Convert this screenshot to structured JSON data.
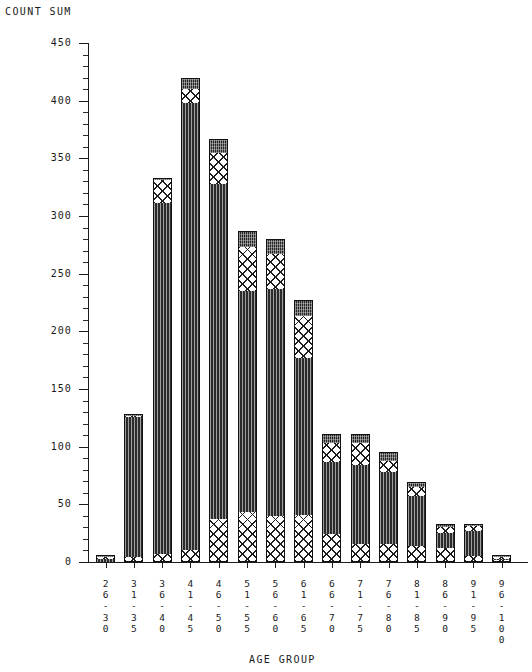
{
  "titles": {
    "y_axis": "COUNT SUM",
    "x_axis": "AGE GROUP"
  },
  "y_ticks": [
    "450",
    "400",
    "350",
    "300",
    "250",
    "200",
    "150",
    "100",
    "50",
    "0"
  ],
  "chart_data": {
    "type": "bar",
    "title": "COUNT SUM",
    "xlabel": "AGE GROUP",
    "ylabel": "COUNT SUM",
    "stacked": true,
    "grid": false,
    "legend": "none",
    "ylim": [
      0,
      450
    ],
    "ytick_step": 50,
    "yminor_step": 10,
    "categories": [
      "26-30",
      "31-35",
      "36-40",
      "41-45",
      "46-50",
      "51-55",
      "56-60",
      "61-65",
      "66-70",
      "71-75",
      "76-80",
      "81-85",
      "86-90",
      "91-95",
      "96-100"
    ],
    "series": [
      {
        "name": "segment-1-hatch-bottom",
        "pattern": "crosshatch",
        "values": [
          0,
          4,
          7,
          10,
          37,
          43,
          40,
          41,
          24,
          16,
          16,
          14,
          12,
          5,
          2
        ]
      },
      {
        "name": "segment-2-solid",
        "pattern": "solid-dark",
        "values": [
          3,
          122,
          304,
          388,
          291,
          192,
          197,
          136,
          63,
          68,
          62,
          43,
          13,
          22,
          1
        ]
      },
      {
        "name": "segment-3-hatch-upper",
        "pattern": "crosshatch",
        "values": [
          1,
          1,
          20,
          12,
          27,
          38,
          30,
          36,
          16,
          19,
          10,
          8,
          5,
          4,
          1
        ]
      },
      {
        "name": "segment-4-cap-dark",
        "pattern": "dark-cap",
        "values": [
          1,
          1,
          2,
          10,
          12,
          14,
          13,
          14,
          8,
          8,
          7,
          4,
          3,
          2,
          1
        ]
      }
    ],
    "totals": [
      5,
      128,
      333,
      420,
      367,
      287,
      280,
      227,
      111,
      111,
      95,
      69,
      33,
      33,
      5
    ]
  },
  "bars": [
    {
      "label_lines": [
        "2",
        "6",
        "-",
        "3",
        "0"
      ],
      "total": 5,
      "segments": [
        {
          "h": 0,
          "p": "hatch"
        },
        {
          "h": 3,
          "p": "dark"
        },
        {
          "h": 1,
          "p": "hatch"
        },
        {
          "h": 1,
          "p": "cap"
        }
      ]
    },
    {
      "label_lines": [
        "3",
        "1",
        "-",
        "3",
        "5"
      ],
      "total": 128,
      "segments": [
        {
          "h": 4,
          "p": "hatch"
        },
        {
          "h": 122,
          "p": "dark"
        },
        {
          "h": 1,
          "p": "hatch"
        },
        {
          "h": 1,
          "p": "cap"
        }
      ]
    },
    {
      "label_lines": [
        "3",
        "6",
        "-",
        "4",
        "0"
      ],
      "total": 333,
      "segments": [
        {
          "h": 7,
          "p": "hatch"
        },
        {
          "h": 304,
          "p": "dark"
        },
        {
          "h": 20,
          "p": "hatch"
        },
        {
          "h": 2,
          "p": "cap"
        }
      ]
    },
    {
      "label_lines": [
        "4",
        "1",
        "-",
        "4",
        "5"
      ],
      "total": 420,
      "segments": [
        {
          "h": 10,
          "p": "hatch"
        },
        {
          "h": 388,
          "p": "dark"
        },
        {
          "h": 12,
          "p": "hatch"
        },
        {
          "h": 10,
          "p": "cap"
        }
      ]
    },
    {
      "label_lines": [
        "4",
        "6",
        "-",
        "5",
        "0"
      ],
      "total": 367,
      "segments": [
        {
          "h": 37,
          "p": "hatch"
        },
        {
          "h": 291,
          "p": "dark"
        },
        {
          "h": 27,
          "p": "hatch"
        },
        {
          "h": 12,
          "p": "cap"
        }
      ]
    },
    {
      "label_lines": [
        "5",
        "1",
        "-",
        "5",
        "5"
      ],
      "total": 287,
      "segments": [
        {
          "h": 43,
          "p": "hatch"
        },
        {
          "h": 192,
          "p": "dark"
        },
        {
          "h": 38,
          "p": "hatch"
        },
        {
          "h": 14,
          "p": "cap"
        }
      ]
    },
    {
      "label_lines": [
        "5",
        "6",
        "-",
        "6",
        "0"
      ],
      "total": 280,
      "segments": [
        {
          "h": 40,
          "p": "hatch"
        },
        {
          "h": 197,
          "p": "dark"
        },
        {
          "h": 30,
          "p": "hatch"
        },
        {
          "h": 13,
          "p": "cap"
        }
      ]
    },
    {
      "label_lines": [
        "6",
        "1",
        "-",
        "6",
        "5"
      ],
      "total": 227,
      "segments": [
        {
          "h": 41,
          "p": "hatch"
        },
        {
          "h": 136,
          "p": "dark"
        },
        {
          "h": 36,
          "p": "hatch"
        },
        {
          "h": 14,
          "p": "cap"
        }
      ]
    },
    {
      "label_lines": [
        "6",
        "6",
        "-",
        "7",
        "0"
      ],
      "total": 111,
      "segments": [
        {
          "h": 24,
          "p": "hatch"
        },
        {
          "h": 63,
          "p": "dark"
        },
        {
          "h": 16,
          "p": "hatch"
        },
        {
          "h": 8,
          "p": "cap"
        }
      ]
    },
    {
      "label_lines": [
        "7",
        "1",
        "-",
        "7",
        "5"
      ],
      "total": 111,
      "segments": [
        {
          "h": 16,
          "p": "hatch"
        },
        {
          "h": 68,
          "p": "dark"
        },
        {
          "h": 19,
          "p": "hatch"
        },
        {
          "h": 8,
          "p": "cap"
        }
      ]
    },
    {
      "label_lines": [
        "7",
        "6",
        "-",
        "8",
        "0"
      ],
      "total": 95,
      "segments": [
        {
          "h": 16,
          "p": "hatch"
        },
        {
          "h": 62,
          "p": "dark"
        },
        {
          "h": 10,
          "p": "hatch"
        },
        {
          "h": 7,
          "p": "cap"
        }
      ]
    },
    {
      "label_lines": [
        "8",
        "1",
        "-",
        "8",
        "5"
      ],
      "total": 69,
      "segments": [
        {
          "h": 14,
          "p": "hatch"
        },
        {
          "h": 43,
          "p": "dark"
        },
        {
          "h": 8,
          "p": "hatch"
        },
        {
          "h": 4,
          "p": "cap"
        }
      ]
    },
    {
      "label_lines": [
        "8",
        "6",
        "-",
        "9",
        "0"
      ],
      "total": 33,
      "segments": [
        {
          "h": 12,
          "p": "hatch"
        },
        {
          "h": 13,
          "p": "dark"
        },
        {
          "h": 5,
          "p": "hatch"
        },
        {
          "h": 3,
          "p": "cap"
        }
      ]
    },
    {
      "label_lines": [
        "9",
        "1",
        "-",
        "9",
        "5"
      ],
      "total": 33,
      "segments": [
        {
          "h": 5,
          "p": "hatch"
        },
        {
          "h": 22,
          "p": "dark"
        },
        {
          "h": 4,
          "p": "hatch"
        },
        {
          "h": 2,
          "p": "cap"
        }
      ]
    },
    {
      "label_lines": [
        "9",
        "6",
        "-",
        "1",
        "0",
        "0"
      ],
      "total": 5,
      "segments": [
        {
          "h": 2,
          "p": "hatch"
        },
        {
          "h": 1,
          "p": "dark"
        },
        {
          "h": 1,
          "p": "hatch"
        },
        {
          "h": 1,
          "p": "cap"
        }
      ]
    }
  ],
  "colors": {
    "ink": "#1d1d1d",
    "dark_fill": "#2b2b2b",
    "cap_fill": "#242424",
    "hatch_bg": "#ffffff",
    "background": "#ffffff"
  }
}
